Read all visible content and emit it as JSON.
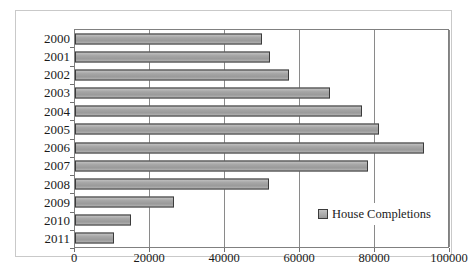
{
  "top_fragment": "",
  "legend": {
    "entries": [
      {
        "label": "House Completions",
        "swatch_name": "legend-swatch-house-completions"
      }
    ],
    "position": "inside-bottom-right"
  },
  "axes": {
    "x_ticks": [
      "0",
      "20000",
      "40000",
      "60000",
      "80000",
      "100000"
    ],
    "y_ticks": [
      "2000",
      "2001",
      "2002",
      "2003",
      "2004",
      "2005",
      "2006",
      "2007",
      "2008",
      "2009",
      "2010",
      "2011"
    ]
  },
  "colors": {
    "bar_fill": "#a8a8a8",
    "bar_border": "#3b3b3b",
    "gridline": "#8a8a8a",
    "plot_border": "#808080",
    "frame_border": "#c9c9c9",
    "text": "#1a1a1a",
    "background": "#ffffff"
  },
  "chart_data": {
    "type": "bar",
    "orientation": "horizontal",
    "title": "",
    "subtitle": "",
    "xlabel": "",
    "ylabel": "",
    "xlim": [
      0,
      100000
    ],
    "ylim": null,
    "grid": true,
    "legend_position": "inside-bottom-right",
    "categories": [
      "2000",
      "2001",
      "2002",
      "2003",
      "2004",
      "2005",
      "2006",
      "2007",
      "2008",
      "2009",
      "2010",
      "2011"
    ],
    "series": [
      {
        "name": "House Completions",
        "values": [
          49800,
          52000,
          57000,
          68000,
          76500,
          81000,
          93000,
          78000,
          51800,
          26400,
          14800,
          10500
        ]
      }
    ],
    "xtick_values": [
      0,
      20000,
      40000,
      60000,
      80000,
      100000
    ],
    "xtick_labels": [
      "0",
      "20000",
      "40000",
      "60000",
      "80000",
      "100000"
    ]
  }
}
